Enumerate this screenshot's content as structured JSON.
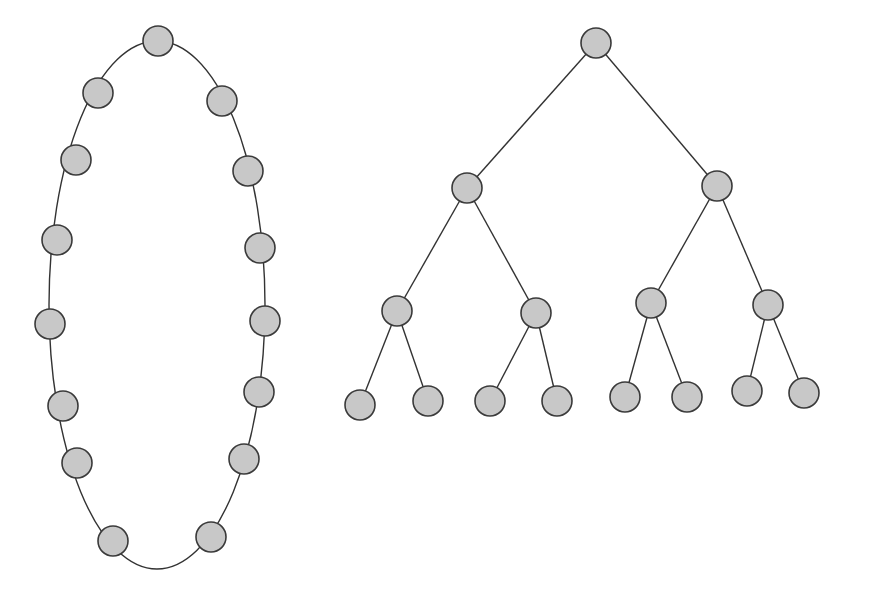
{
  "colors": {
    "background": "#ffffff",
    "node_fill": "#c8c8c8",
    "node_stroke": "#3a3a3a",
    "edge": "#333333"
  },
  "node_radius": 15,
  "ring": {
    "type": "cycle-graph",
    "node_count": 16,
    "ellipse": {
      "cx": 157,
      "cy": 305,
      "rx": 108,
      "ry": 264
    },
    "nodes": [
      {
        "x": 158,
        "y": 41
      },
      {
        "x": 222,
        "y": 101
      },
      {
        "x": 248,
        "y": 171
      },
      {
        "x": 260,
        "y": 248
      },
      {
        "x": 265,
        "y": 321
      },
      {
        "x": 259,
        "y": 392
      },
      {
        "x": 244,
        "y": 459
      },
      {
        "x": 211,
        "y": 537
      },
      {
        "x": 113,
        "y": 541
      },
      {
        "x": 77,
        "y": 463
      },
      {
        "x": 63,
        "y": 406
      },
      {
        "x": 50,
        "y": 324
      },
      {
        "x": 57,
        "y": 240
      },
      {
        "x": 76,
        "y": 160
      },
      {
        "x": 98,
        "y": 93
      }
    ]
  },
  "tree": {
    "type": "binary-tree",
    "depth": 4,
    "node_count": 15,
    "nodes": [
      {
        "id": "root",
        "x": 596,
        "y": 43
      },
      {
        "id": "L",
        "x": 467,
        "y": 188
      },
      {
        "id": "R",
        "x": 717,
        "y": 186
      },
      {
        "id": "LL",
        "x": 397,
        "y": 311
      },
      {
        "id": "LR",
        "x": 536,
        "y": 313
      },
      {
        "id": "RL",
        "x": 651,
        "y": 303
      },
      {
        "id": "RR",
        "x": 768,
        "y": 305
      },
      {
        "id": "LLL",
        "x": 360,
        "y": 405
      },
      {
        "id": "LLR",
        "x": 428,
        "y": 401
      },
      {
        "id": "LRL",
        "x": 490,
        "y": 401
      },
      {
        "id": "LRR",
        "x": 557,
        "y": 401
      },
      {
        "id": "RLL",
        "x": 625,
        "y": 397
      },
      {
        "id": "RLR",
        "x": 687,
        "y": 397
      },
      {
        "id": "RRL",
        "x": 747,
        "y": 391
      },
      {
        "id": "RRR",
        "x": 804,
        "y": 393
      }
    ],
    "edges": [
      [
        "root",
        "L"
      ],
      [
        "root",
        "R"
      ],
      [
        "L",
        "LL"
      ],
      [
        "L",
        "LR"
      ],
      [
        "R",
        "RL"
      ],
      [
        "R",
        "RR"
      ],
      [
        "LL",
        "LLL"
      ],
      [
        "LL",
        "LLR"
      ],
      [
        "LR",
        "LRL"
      ],
      [
        "LR",
        "LRR"
      ],
      [
        "RL",
        "RLL"
      ],
      [
        "RL",
        "RLR"
      ],
      [
        "RR",
        "RRL"
      ],
      [
        "RR",
        "RRR"
      ]
    ]
  }
}
